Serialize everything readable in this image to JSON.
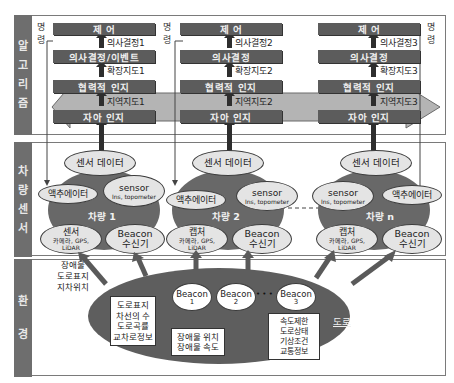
{
  "sections": {
    "algorithm": {
      "label": [
        "알",
        "고",
        "리",
        "즘"
      ]
    },
    "vehicle_sensor": {
      "label": [
        "차",
        "량",
        "센",
        "서"
      ]
    },
    "environment": {
      "label": [
        "환",
        "경"
      ]
    }
  },
  "command_label": [
    "명",
    "령"
  ],
  "columns": [
    {
      "control": "제  어",
      "decision": "의사결정/이벤트",
      "decision_out": "의사결정1",
      "coop": "협력적 인지",
      "coop_out": "확장지도1",
      "self": "자아 인지",
      "self_out": "지역지도1"
    },
    {
      "control": "제  어",
      "decision": "의사결정",
      "decision_out": "의사결정2",
      "coop": "협력적 인지",
      "coop_out": "확장지도2",
      "self": "자아 인지",
      "self_out": "지역지도2"
    },
    {
      "control": "제  어",
      "decision": "의사결정",
      "decision_out": "의사결정3",
      "coop": "협력적 인지",
      "coop_out": "확장지도3",
      "self": "자아 인지",
      "self_out": "지역지도3"
    }
  ],
  "vehicles": [
    {
      "name": "차량 1",
      "sensor_data": "센서 데이터",
      "actuator": "액추에이터",
      "sensor_title": "sensor",
      "sensor_sub": "Ins, topometer",
      "capture_title": "센서",
      "capture_sub1": "카메라, GPS,",
      "capture_sub2": "LiDAR",
      "beacon_title": "Beacon",
      "beacon_sub": "수신기"
    },
    {
      "name": "차량 2",
      "sensor_data": "센서 데이터",
      "actuator": "액추에이터",
      "sensor_title": "sensor",
      "sensor_sub": "Ins, topometer",
      "capture_title": "캡처",
      "capture_sub1": "카메라, GPS,",
      "capture_sub2": "LiDAR",
      "beacon_title": "Beacon",
      "beacon_sub": "수신기"
    },
    {
      "name": "차량 n",
      "sensor_data": "센서 데이터",
      "actuator": "액추에이터",
      "sensor_title": "sensor",
      "sensor_sub": "Ins, topometer",
      "capture_title": "캡처",
      "capture_sub1": "카메라, GPS,",
      "capture_sub2": "LiDAR",
      "beacon_title": "Beacon",
      "beacon_sub": "수신기"
    }
  ],
  "environment": {
    "side_label": [
      "장애물",
      "도로표지",
      "지차위치"
    ],
    "road_info": [
      "도로표지",
      "차선의 수",
      "도로곡률",
      "교차로정보"
    ],
    "obstacle_info": [
      "장애물 위치",
      "장애물 속도"
    ],
    "beacons": [
      {
        "title": "Beacon",
        "num": "1"
      },
      {
        "title": "Beacon",
        "num": "2"
      },
      {
        "title": "Beacon",
        "num": "3"
      }
    ],
    "beacon_ellipsis": "• • •",
    "traffic_info": [
      "속도제한",
      "도로상태",
      "기상조건",
      "교통정보"
    ],
    "road_label": "도로"
  },
  "colors": {
    "box": "#5c5c5c",
    "section_label": "#6e6e6e",
    "vehicle_blob": "#686868",
    "ellipse_fill": "#e4e4e4",
    "band_arrow": "#b4b4b4"
  }
}
